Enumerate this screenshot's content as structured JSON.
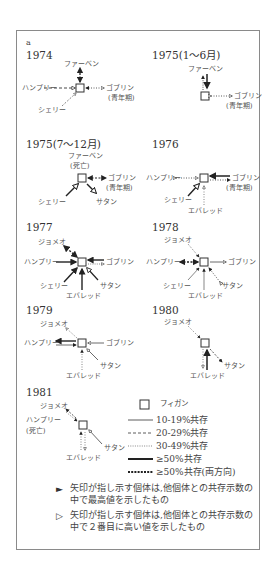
{
  "figure": {
    "panel_letter": "a",
    "panels": [
      {
        "year": "1974",
        "labels": {
          "top": "ファーベン",
          "left": "ハンプリー",
          "right": "ゴブリン",
          "right_sub": "(青年期)",
          "bottom_left": "シェリー"
        }
      },
      {
        "year": "1975(1～6月)",
        "labels": {
          "top": "ファーベン",
          "right": "ゴブリン",
          "right_sub": "(青年期)"
        }
      },
      {
        "year": "1975(7～12月)",
        "labels": {
          "top": "ファーベン",
          "top_sub": "(死亡)",
          "right": "ゴブリン",
          "right_sub": "(青年期)",
          "bottom_left": "シェリー",
          "bottom_right": "サタン"
        }
      },
      {
        "year": "1976",
        "labels": {
          "left": "ハンプリー",
          "right": "ゴブリン",
          "right_sub": "(青年期)",
          "bottom_left": "シェリー",
          "bottom": "エバレッド"
        }
      },
      {
        "year": "1977",
        "labels": {
          "top_left": "ジョメオ",
          "left": "ハンプリー",
          "right": "ゴブリン",
          "bottom_left": "シェリー",
          "bottom_right": "サタン",
          "bottom": "エバレッド"
        }
      },
      {
        "year": "1978",
        "labels": {
          "top_left": "ジョメオ",
          "left": "ハンプリー",
          "right": "ゴブリン",
          "bottom_left": "シェリー",
          "bottom_right": "サタン",
          "bottom": "エバレッド"
        }
      },
      {
        "year": "1979",
        "labels": {
          "top_left": "ジョメオ",
          "left": "ハンプリー",
          "right": "ゴブリン",
          "bottom_right": "サタン",
          "bottom": "エバレッド"
        }
      },
      {
        "year": "1980",
        "labels": {
          "top_left": "ジョメオ",
          "bottom_right": "サタン",
          "bottom": "エバレッド"
        }
      },
      {
        "year": "1981",
        "labels": {
          "top_left": "ジョメオ",
          "left": "ハンプリー",
          "left_sub": "(死亡)",
          "bottom_right": "サタン",
          "bottom": "エバレッド"
        }
      }
    ],
    "legend": {
      "center_symbol_label": "フィガン",
      "items": [
        {
          "style": "solid-thin",
          "label": "10-19%共存"
        },
        {
          "style": "dashed",
          "label": "20-29%共存"
        },
        {
          "style": "dotted",
          "label": "30-49%共存"
        },
        {
          "style": "solid-thick",
          "label": "≥50%共存"
        },
        {
          "style": "thick-dashed",
          "label": "≥50%共存(両方向)"
        }
      ],
      "notes": [
        {
          "icon": "filled-arrowhead",
          "symbol": "►",
          "text": "矢印が指し示す個体は,他個体との共存示数の中で最高値を示したもの"
        },
        {
          "icon": "open-arrowhead",
          "symbol": "▷",
          "text": "矢印が指し示す個体は,他個体との共存示数の中で２番目に高い値を示したもの"
        }
      ]
    },
    "colors": {
      "line": "#2b2b2b",
      "light_line": "#777777",
      "frame": "#8a8a8a",
      "text": "#444444"
    }
  }
}
